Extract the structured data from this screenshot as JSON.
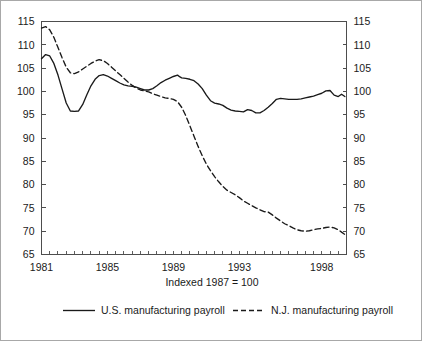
{
  "figure": {
    "caption": "Indexed 1987 = 100",
    "border_color": "#a8a8a8",
    "background": "#ffffff",
    "line_color": "#1a1a1a"
  },
  "legend": {
    "position": "bottom",
    "entries": [
      {
        "label": "U.S. manufacturing payroll",
        "style": "solid"
      },
      {
        "label": "N.J. manufacturing payroll",
        "style": "dashed"
      }
    ]
  },
  "chart_data": {
    "type": "line",
    "title": "",
    "subtitle": "Indexed 1987 = 100",
    "xlabel": "",
    "ylabel": "",
    "ylim": [
      65,
      115
    ],
    "xlim": [
      1981.0,
      1999.5
    ],
    "grid": false,
    "y_ticks": [
      65,
      70,
      75,
      80,
      85,
      90,
      95,
      100,
      105,
      110,
      115
    ],
    "y_tick_labels": [
      "65",
      "70",
      "75",
      "80",
      "85",
      "90",
      "95",
      "100",
      "105",
      "110",
      "115"
    ],
    "dual_y_axis": true,
    "x_tick_labels": [
      "1981",
      "1985",
      "1989",
      "1993",
      "1998"
    ],
    "x_tick_label_values": [
      1981,
      1985,
      1989,
      1993,
      1998
    ],
    "x_minor_tick_interval_years": 0.5,
    "series": [
      {
        "name": "U.S. manufacturing payroll",
        "style": "solid",
        "x": [
          1981.0,
          1981.25,
          1981.5,
          1981.75,
          1982.0,
          1982.25,
          1982.5,
          1982.75,
          1983.0,
          1983.25,
          1983.5,
          1983.75,
          1984.0,
          1984.25,
          1984.5,
          1984.75,
          1985.0,
          1985.25,
          1985.5,
          1985.75,
          1986.0,
          1986.25,
          1986.5,
          1986.75,
          1987.0,
          1987.25,
          1987.5,
          1987.75,
          1988.0,
          1988.25,
          1988.5,
          1988.75,
          1989.0,
          1989.25,
          1989.4,
          1989.5,
          1989.75,
          1990.0,
          1990.25,
          1990.5,
          1990.75,
          1991.0,
          1991.25,
          1991.5,
          1991.75,
          1992.0,
          1992.25,
          1992.5,
          1992.75,
          1993.0,
          1993.25,
          1993.5,
          1993.75,
          1994.0,
          1994.25,
          1994.5,
          1994.75,
          1995.0,
          1995.25,
          1995.5,
          1995.75,
          1996.0,
          1996.25,
          1996.5,
          1996.75,
          1997.0,
          1997.25,
          1997.5,
          1997.75,
          1998.0,
          1998.25,
          1998.5,
          1998.75,
          1999.0,
          1999.2,
          1999.4
        ],
        "y": [
          107.0,
          107.9,
          107.6,
          106.0,
          103.5,
          100.5,
          97.5,
          95.8,
          95.7,
          95.8,
          97.2,
          99.3,
          101.2,
          102.6,
          103.4,
          103.6,
          103.3,
          102.8,
          102.3,
          101.8,
          101.4,
          101.2,
          101.1,
          100.9,
          100.6,
          100.3,
          100.3,
          100.6,
          101.2,
          101.9,
          102.4,
          102.8,
          103.2,
          103.5,
          103.1,
          102.9,
          102.8,
          102.6,
          102.3,
          101.6,
          100.6,
          99.2,
          98.0,
          97.5,
          97.3,
          97.0,
          96.4,
          96.0,
          95.8,
          95.7,
          95.6,
          96.1,
          95.9,
          95.4,
          95.4,
          95.9,
          96.6,
          97.4,
          98.3,
          98.5,
          98.4,
          98.3,
          98.3,
          98.3,
          98.4,
          98.6,
          98.8,
          99.0,
          99.3,
          99.6,
          100.1,
          100.2,
          99.2,
          98.9,
          99.4,
          98.9
        ]
      },
      {
        "name": "N.J. manufacturing payroll",
        "style": "dashed",
        "x": [
          1981.0,
          1981.25,
          1981.5,
          1981.75,
          1982.0,
          1982.25,
          1982.5,
          1982.75,
          1983.0,
          1983.25,
          1983.5,
          1983.75,
          1984.0,
          1984.25,
          1984.5,
          1984.75,
          1985.0,
          1985.25,
          1985.5,
          1985.75,
          1986.0,
          1986.25,
          1986.5,
          1986.75,
          1987.0,
          1987.25,
          1987.5,
          1987.75,
          1988.0,
          1988.25,
          1988.5,
          1988.75,
          1989.0,
          1989.25,
          1989.5,
          1989.75,
          1990.0,
          1990.25,
          1990.5,
          1990.75,
          1991.0,
          1991.25,
          1991.5,
          1991.75,
          1992.0,
          1992.25,
          1992.5,
          1992.75,
          1993.0,
          1993.25,
          1993.5,
          1993.75,
          1994.0,
          1994.25,
          1994.5,
          1994.75,
          1995.0,
          1995.25,
          1995.5,
          1995.75,
          1996.0,
          1996.25,
          1996.5,
          1996.75,
          1997.0,
          1997.25,
          1997.5,
          1997.75,
          1998.0,
          1998.25,
          1998.5,
          1998.75,
          1999.0,
          1999.2,
          1999.4
        ],
        "y": [
          113.6,
          113.9,
          113.2,
          111.6,
          109.4,
          107.2,
          105.2,
          104.0,
          103.8,
          104.2,
          104.8,
          105.4,
          106.0,
          106.5,
          106.8,
          106.6,
          106.0,
          105.2,
          104.4,
          103.6,
          102.8,
          102.0,
          101.3,
          100.7,
          100.3,
          100.1,
          99.9,
          99.5,
          99.2,
          98.9,
          98.6,
          98.5,
          98.3,
          97.8,
          96.6,
          94.8,
          92.6,
          90.4,
          88.2,
          86.2,
          84.4,
          83.0,
          81.7,
          80.6,
          79.6,
          78.8,
          78.3,
          77.8,
          77.2,
          76.5,
          76.0,
          75.5,
          75.0,
          74.6,
          74.2,
          74.1,
          73.5,
          72.8,
          72.2,
          71.6,
          71.2,
          70.7,
          70.3,
          70.1,
          70.0,
          70.1,
          70.3,
          70.5,
          70.6,
          70.8,
          70.9,
          70.7,
          70.3,
          69.8,
          69.3
        ]
      }
    ]
  }
}
